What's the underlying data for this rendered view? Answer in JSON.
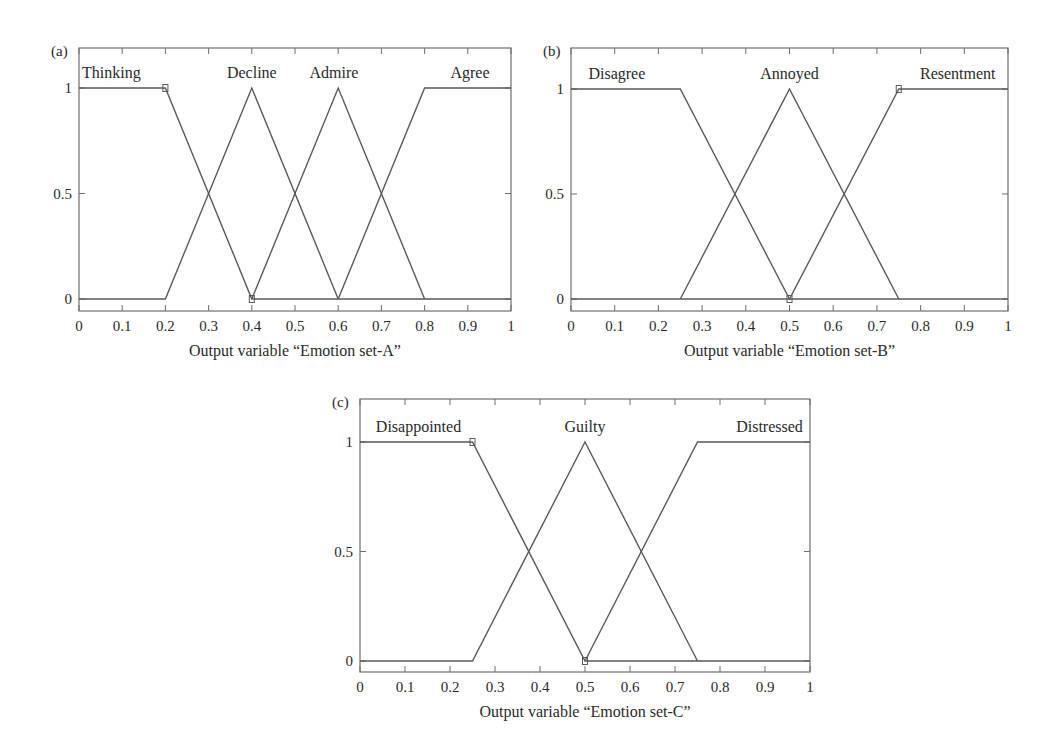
{
  "chart_data": [
    {
      "type": "line",
      "panel": "(a)",
      "title": "",
      "xlabel": "Output variable “Emotion set-A”",
      "ylabel": "",
      "xlim": [
        0,
        1
      ],
      "ylim": [
        -0.05,
        1.2
      ],
      "x_ticks": [
        "0",
        "0.1",
        "0.2",
        "0.3",
        "0.4",
        "0.5",
        "0.6",
        "0.7",
        "0.8",
        "0.9",
        "1"
      ],
      "y_ticks": [
        "0",
        "0.5",
        "1"
      ],
      "grid": false,
      "legend": "inline labels above peaks",
      "series": [
        {
          "name": "Thinking",
          "x": [
            0,
            0.2,
            0.4,
            1
          ],
          "y": [
            1,
            1,
            0,
            0
          ],
          "label_x": 0.075
        },
        {
          "name": "Decline",
          "x": [
            0,
            0.2,
            0.4,
            0.6
          ],
          "y": [
            0,
            0,
            1,
            0
          ],
          "label_x": 0.4
        },
        {
          "name": "Admire",
          "x": [
            0.4,
            0.6,
            0.8
          ],
          "y": [
            0,
            1,
            0
          ],
          "label_x": 0.59
        },
        {
          "name": "Agree",
          "x": [
            0.6,
            0.8,
            1
          ],
          "y": [
            0,
            1,
            1
          ],
          "label_x": 0.905
        }
      ],
      "markers": [
        {
          "x": 0.2,
          "y": 1
        },
        {
          "x": 0.4,
          "y": 0
        }
      ]
    },
    {
      "type": "line",
      "panel": "(b)",
      "title": "",
      "xlabel": "Output variable “Emotion set-B”",
      "ylabel": "",
      "xlim": [
        0,
        1
      ],
      "ylim": [
        -0.05,
        1.2
      ],
      "x_ticks": [
        "0",
        "0.1",
        "0.2",
        "0.3",
        "0.4",
        "0.5",
        "0.6",
        "0.7",
        "0.8",
        "0.9",
        "1"
      ],
      "y_ticks": [
        "0",
        "0.5",
        "1"
      ],
      "grid": false,
      "legend": "inline labels above peaks",
      "series": [
        {
          "name": "Disagree",
          "x": [
            0,
            0.25,
            0.5,
            1
          ],
          "y": [
            1,
            1,
            0,
            0
          ],
          "label_x": 0.105
        },
        {
          "name": "Annoyed",
          "x": [
            0.25,
            0.5,
            0.75
          ],
          "y": [
            0,
            1,
            0
          ],
          "label_x": 0.5
        },
        {
          "name": "Resentment",
          "x": [
            0,
            0.25,
            0.5,
            0.75,
            1
          ],
          "y": [
            0,
            0,
            0,
            1,
            1
          ],
          "label_x": 0.885
        }
      ],
      "markers": [
        {
          "x": 0.75,
          "y": 1
        },
        {
          "x": 0.5,
          "y": 0
        }
      ]
    },
    {
      "type": "line",
      "panel": "(c)",
      "title": "",
      "xlabel": "Output variable “Emotion set-C”",
      "ylabel": "",
      "xlim": [
        0,
        1
      ],
      "ylim": [
        -0.05,
        1.2
      ],
      "x_ticks": [
        "0",
        "0.1",
        "0.2",
        "0.3",
        "0.4",
        "0.5",
        "0.6",
        "0.7",
        "0.8",
        "0.9",
        "1"
      ],
      "y_ticks": [
        "0",
        "0.5",
        "1"
      ],
      "grid": false,
      "legend": "inline labels above peaks",
      "series": [
        {
          "name": "Disappointed",
          "x": [
            0,
            0.25,
            0.5,
            1
          ],
          "y": [
            1,
            1,
            0,
            0
          ],
          "label_x": 0.13
        },
        {
          "name": "Guilty",
          "x": [
            0,
            0.25,
            0.5,
            0.75
          ],
          "y": [
            0,
            0,
            1,
            0
          ],
          "label_x": 0.5
        },
        {
          "name": "Distressed",
          "x": [
            0.5,
            0.75,
            1
          ],
          "y": [
            0,
            1,
            1
          ],
          "label_x": 0.91
        }
      ],
      "markers": [
        {
          "x": 0.25,
          "y": 1
        },
        {
          "x": 0.5,
          "y": 0
        }
      ]
    }
  ],
  "layout": {
    "panels": [
      {
        "left": 79,
        "right": 511,
        "top": 48,
        "bottom": 311,
        "y1": 88,
        "y0": 299
      },
      {
        "left": 571,
        "right": 1008,
        "top": 48,
        "bottom": 311,
        "y1": 89,
        "y0": 299
      },
      {
        "left": 360,
        "right": 810,
        "top": 399,
        "bottom": 672,
        "y1": 442,
        "y0": 661
      }
    ],
    "colors": {
      "frame": "#6e6e6e",
      "line": "#5a5a5a",
      "text": "#2a2a2a"
    }
  }
}
